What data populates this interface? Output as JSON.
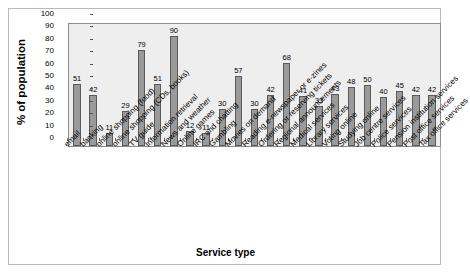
{
  "chart_data": {
    "type": "bar",
    "title": "Most wanted services in Digital TV",
    "xlabel": "Service type",
    "ylabel": "% of population",
    "ylim": [
      0,
      100
    ],
    "ytick_step": 10,
    "yticks": [
      100,
      90,
      80,
      70,
      60,
      50,
      40,
      30,
      20,
      10,
      0
    ],
    "grid": false,
    "legend": null,
    "bar_color": "#9a9a9a",
    "bar_border_color": "#5a5a5a",
    "plot_background": "#eeeeee",
    "categories": [
      "email",
      "banking",
      "online shopping (food)",
      "online shopping (CDs, books)",
      "TV guide",
      "Information retrieval",
      "News and weather",
      "Online games",
      "IRC and chatting",
      "Gambling",
      "Movies on demand",
      "Reading e-newspaper or e-zines",
      "Ordering or reserving tickets",
      "Regional announcements",
      "Medical services",
      "Library services",
      "Voting online",
      "Studying online",
      "Job centre services",
      "Police services",
      "Pension institution services",
      "Post office services",
      "Tax office services"
    ],
    "values": [
      51,
      42,
      11,
      29,
      79,
      51,
      90,
      12,
      11,
      30,
      57,
      30,
      42,
      68,
      41,
      33,
      43,
      48,
      50,
      40,
      45,
      42,
      42
    ],
    "value_labels": [
      "51",
      "42",
      "11",
      "29",
      "79",
      "51",
      "90",
      "12",
      "11",
      "30",
      "57",
      "30",
      "42",
      "68",
      "41",
      "33",
      "43",
      "48",
      "50",
      "40",
      "45",
      "42",
      "42"
    ]
  }
}
